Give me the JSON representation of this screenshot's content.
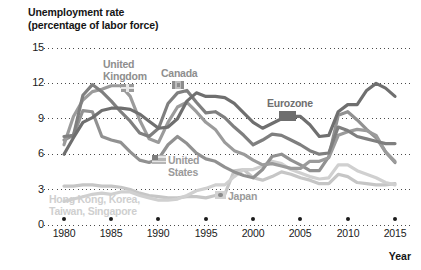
{
  "chart_data": {
    "type": "line",
    "title": "Unemployment rate",
    "subtitle": "(percentage of labor force)",
    "xlabel": "Year",
    "ylabel": "",
    "xlim": [
      1979,
      2016
    ],
    "ylim": [
      0,
      15
    ],
    "yticks": [
      "15",
      "12",
      "9",
      "6",
      "3",
      "0"
    ],
    "ytick_values": [
      15,
      12,
      9,
      6,
      3,
      0
    ],
    "xticks": [
      "1980",
      "1985",
      "1990",
      "1995",
      "2000",
      "2005",
      "2010",
      "2015"
    ],
    "xtick_values": [
      1980,
      1985,
      1990,
      1995,
      2000,
      2005,
      2010,
      2015
    ],
    "grid": "horizontal-dotted",
    "legend_position": "inline-annotations",
    "x": [
      1980,
      1981,
      1982,
      1983,
      1984,
      1985,
      1986,
      1987,
      1988,
      1989,
      1990,
      1991,
      1992,
      1993,
      1994,
      1995,
      1996,
      1997,
      1998,
      1999,
      2000,
      2001,
      2002,
      2003,
      2004,
      2005,
      2006,
      2007,
      2008,
      2009,
      2010,
      2011,
      2012,
      2013,
      2014,
      2015
    ],
    "series": [
      {
        "name": "United Kingdom",
        "color": "#9b9b9b",
        "values": [
          6.8,
          9.2,
          10.6,
          11.3,
          11.5,
          11.8,
          11.8,
          10.9,
          8.9,
          7.3,
          7.0,
          8.7,
          10.0,
          10.4,
          9.6,
          8.7,
          8.1,
          7.0,
          6.3,
          6.0,
          5.5,
          5.1,
          5.2,
          5.0,
          4.8,
          4.8,
          5.4,
          5.4,
          5.7,
          7.6,
          7.9,
          8.1,
          8.0,
          7.6,
          6.2,
          5.4
        ]
      },
      {
        "name": "Canada",
        "color": "#7f7f7f",
        "values": [
          7.5,
          7.6,
          11.0,
          11.9,
          11.3,
          10.5,
          9.6,
          8.8,
          7.8,
          7.5,
          8.2,
          10.3,
          11.2,
          11.4,
          10.4,
          9.5,
          9.6,
          9.1,
          8.3,
          7.6,
          6.8,
          7.2,
          7.7,
          7.6,
          7.2,
          6.8,
          6.3,
          6.0,
          6.1,
          8.3,
          8.0,
          7.5,
          7.3,
          7.1,
          6.9,
          6.9
        ]
      },
      {
        "name": "Eurozone",
        "color": "#6f6f6f",
        "values": [
          6.0,
          7.4,
          8.7,
          9.1,
          9.7,
          9.9,
          9.9,
          9.8,
          9.4,
          8.8,
          8.2,
          8.3,
          9.0,
          10.5,
          11.2,
          10.9,
          10.9,
          10.8,
          10.3,
          9.5,
          8.7,
          8.2,
          8.6,
          9.0,
          9.2,
          9.2,
          8.5,
          7.5,
          7.6,
          9.6,
          10.2,
          10.2,
          11.4,
          12.0,
          11.6,
          10.9
        ]
      },
      {
        "name": "United States",
        "color": "#919191",
        "values": [
          7.2,
          7.6,
          9.7,
          9.6,
          7.5,
          7.2,
          7.0,
          6.2,
          5.5,
          5.3,
          5.6,
          6.8,
          7.5,
          6.9,
          6.1,
          5.6,
          5.4,
          4.9,
          4.5,
          4.2,
          4.0,
          4.7,
          5.8,
          6.0,
          5.5,
          5.1,
          4.6,
          4.6,
          5.8,
          9.3,
          9.6,
          8.9,
          8.1,
          7.4,
          6.2,
          5.3
        ]
      },
      {
        "name": "Japan",
        "color": "#d0d0d0",
        "values": [
          2.0,
          2.2,
          2.4,
          2.6,
          2.7,
          2.6,
          2.8,
          2.8,
          2.5,
          2.3,
          2.1,
          2.1,
          2.2,
          2.5,
          2.9,
          3.1,
          3.4,
          3.4,
          4.1,
          4.7,
          4.7,
          5.0,
          5.4,
          5.2,
          4.7,
          4.4,
          4.1,
          3.9,
          4.0,
          5.1,
          5.1,
          4.6,
          4.3,
          4.0,
          3.6,
          3.4
        ]
      },
      {
        "name": "Hong Kong, Korea, Taiwan, Singapore",
        "color": "#c6c6c6",
        "values": [
          3.3,
          3.3,
          3.4,
          3.4,
          3.3,
          3.3,
          3.2,
          3.0,
          2.7,
          2.5,
          2.4,
          2.3,
          2.3,
          2.4,
          2.4,
          2.3,
          2.5,
          2.6,
          4.6,
          4.7,
          4.0,
          3.8,
          4.1,
          4.5,
          4.3,
          4.0,
          3.8,
          3.5,
          3.5,
          4.3,
          4.1,
          3.6,
          3.5,
          3.4,
          3.4,
          3.5
        ]
      }
    ],
    "annotations": [
      {
        "key": "uk",
        "text_line1": "United",
        "text_line2": "Kingdom",
        "icon": "uk-flag-icon"
      },
      {
        "key": "ca",
        "text_line1": "Canada",
        "text_line2": "",
        "icon": "canada-flag-icon"
      },
      {
        "key": "eu",
        "text_line1": "Eurozone",
        "text_line2": "",
        "icon": "eu-flag-icon"
      },
      {
        "key": "us",
        "text_line1": "United",
        "text_line2": "States",
        "icon": "us-flag-icon"
      },
      {
        "key": "jp",
        "text_line1": "Japan",
        "text_line2": "",
        "icon": "japan-flag-icon"
      },
      {
        "key": "asia",
        "text_line1": "Hong Kong, Korea,",
        "text_line2": "Taiwan, Singapore",
        "icon": ""
      }
    ]
  },
  "colors": {
    "background": "#ffffff",
    "text": "#1a1a1a",
    "grid": "#4a4a4a"
  }
}
